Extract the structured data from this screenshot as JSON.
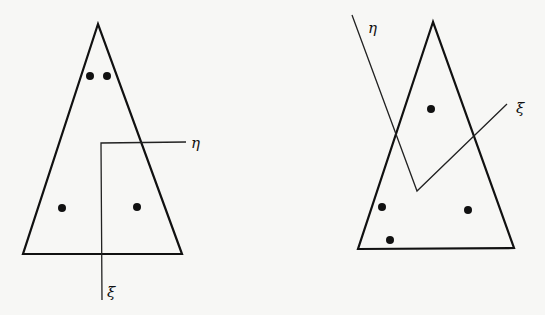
{
  "figures": [
    {
      "name": "left-configuration",
      "triangle": {
        "apex": [
          98,
          24
        ],
        "base_left": [
          23,
          254
        ],
        "base_right": [
          182,
          254
        ]
      },
      "points": [
        [
          90,
          76
        ],
        [
          107,
          76
        ],
        [
          62,
          208
        ],
        [
          137,
          207
        ]
      ],
      "axes": {
        "origin": [
          101,
          143
        ],
        "eta_end": [
          186,
          142
        ],
        "xi_end": [
          102,
          300
        ],
        "eta_label": "η",
        "xi_label": "ξ",
        "eta_label_pos": [
          191,
          148
        ],
        "xi_label_pos": [
          107,
          297
        ]
      }
    },
    {
      "name": "right-configuration",
      "triangle": {
        "apex": [
          433,
          22
        ],
        "base_left": [
          358,
          249
        ],
        "base_right": [
          514,
          248
        ]
      },
      "points": [
        [
          431,
          109
        ],
        [
          382,
          207
        ],
        [
          468,
          210
        ],
        [
          390,
          240
        ]
      ],
      "axes": {
        "origin": [
          417,
          191
        ],
        "eta_end": [
          352,
          15
        ],
        "xi_end": [
          507,
          104
        ],
        "eta_label": "η",
        "xi_label": "ξ",
        "eta_label_pos": [
          368,
          33
        ],
        "xi_label_pos": [
          516,
          113
        ]
      }
    }
  ],
  "colors": {
    "ink": "#111111",
    "paper": "#f7f7f5"
  }
}
